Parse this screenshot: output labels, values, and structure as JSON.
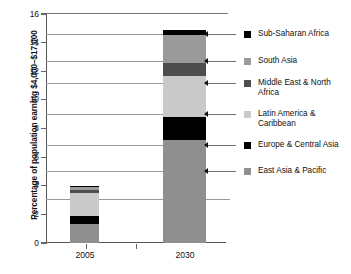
{
  "chart_data": {
    "type": "bar",
    "subtype": "stacked-bar",
    "title": "",
    "xlabel": "",
    "ylabel": "Percentage of population earning $4,000–$17,000",
    "categories": [
      "2005",
      "2030"
    ],
    "ylim": [
      0,
      16
    ],
    "yticks": [
      0,
      2,
      4,
      6,
      8,
      10,
      12,
      14,
      16
    ],
    "ytick_labels": [
      "0",
      "2",
      "4",
      "6",
      "8",
      "10",
      "12",
      "14",
      "16"
    ],
    "grid": false,
    "legend_position": "right",
    "series": [
      {
        "name": "East Asia & Pacific",
        "color": "#8f8f8f",
        "values": [
          1.3,
          7.2
        ]
      },
      {
        "name": "Europe & Central Asia",
        "color": "#000000",
        "values": [
          0.6,
          1.6
        ]
      },
      {
        "name": "Latin America & Caribbean",
        "color": "#c9c9c9",
        "values": [
          1.6,
          2.9
        ]
      },
      {
        "name": "Middle East & North Africa",
        "color": "#4d4d4d",
        "values": [
          0.2,
          0.9
        ]
      },
      {
        "name": "South Asia",
        "color": "#9a9a9a",
        "values": [
          0.2,
          1.9
        ]
      },
      {
        "name": "Sub-Saharan Africa",
        "color": "#000000",
        "values": [
          0.1,
          0.4
        ]
      }
    ],
    "totals": [
      4.0,
      14.9
    ],
    "stack_order_bottom_to_top": [
      "East Asia & Pacific",
      "Europe & Central Asia",
      "Latin America & Caribbean",
      "Middle East & North Africa",
      "South Asia",
      "Sub-Saharan Africa"
    ]
  },
  "axis": {
    "y_title": "Percentage of population earning $4,000–$17,000",
    "y_labels": [
      "16",
      "14",
      "12",
      "10",
      "8",
      "6",
      "4",
      "2",
      "0"
    ],
    "x_labels": [
      "2005",
      "2030"
    ]
  },
  "legend": {
    "items": [
      {
        "label": "Sub-Saharan Africa",
        "color": "#000000"
      },
      {
        "label": "South Asia",
        "color": "#9a9a9a"
      },
      {
        "label": "Middle East & North Africa",
        "color": "#4d4d4d"
      },
      {
        "label": "Latin America & Caribbean",
        "color": "#c9c9c9"
      },
      {
        "label": "Europe & Central Asia",
        "color": "#000000"
      },
      {
        "label": "East Asia & Pacific",
        "color": "#8f8f8f"
      }
    ]
  }
}
